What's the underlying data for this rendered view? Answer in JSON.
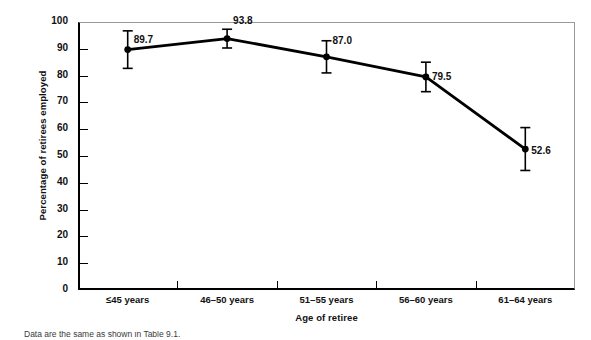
{
  "chart_data": {
    "type": "line",
    "title": "",
    "xlabel": "Age of retiree",
    "ylabel": "Percentage of retirees employed",
    "categories": [
      "≤45 years",
      "46–50 years",
      "51–55 years",
      "56–60 years",
      "61–64 years"
    ],
    "values": [
      89.7,
      93.8,
      87.0,
      79.5,
      52.6
    ],
    "value_labels": [
      "89.7",
      "93.8",
      "87.0",
      "79.5",
      "52.6"
    ],
    "error_bars": {
      "lower": [
        82.7,
        90.3,
        81.0,
        74.0,
        44.6
      ],
      "upper": [
        96.7,
        97.3,
        93.0,
        85.0,
        60.6
      ]
    },
    "ylim": [
      0,
      100
    ],
    "ytick_labels": [
      "0",
      "10",
      "20",
      "30",
      "40",
      "50",
      "60",
      "70",
      "80",
      "90",
      "100"
    ],
    "ytick_values": [
      0,
      10,
      20,
      30,
      40,
      50,
      60,
      70,
      80,
      90,
      100
    ],
    "grid": false,
    "legend": null,
    "series_color": "#000000",
    "axis_color": "#000000",
    "frame_color": "#9a9a9a",
    "marker": "circle",
    "marker_size": 4
  },
  "caption": {
    "fragment": "Data are the same as shown in Table 9.1."
  }
}
